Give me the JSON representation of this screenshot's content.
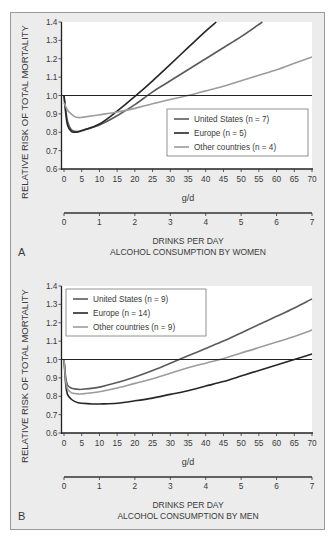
{
  "chart_data": [
    {
      "type": "line",
      "panel_label": "A",
      "title": "ALCOHOL CONSUMPTION BY WOMEN",
      "xlabel": "g/d",
      "xlabel_secondary": "DRINKS PER DAY",
      "ylabel": "RELATIVE RISK OF TOTAL MORTALITY",
      "xlim": [
        0,
        70
      ],
      "ylim": [
        0.6,
        1.4
      ],
      "xticks": [
        "0",
        "5",
        "10",
        "15",
        "20",
        "25",
        "30",
        "35",
        "40",
        "45",
        "50",
        "55",
        "60",
        "65",
        "70"
      ],
      "xticks_secondary": [
        "0",
        "1",
        "2",
        "3",
        "4",
        "5",
        "6",
        "7"
      ],
      "yticks": [
        "1.4",
        "1.3",
        "1.2",
        "1.1",
        "1.0",
        "0.9",
        "0.8",
        "0.7",
        "0.6"
      ],
      "reference_line": 1.0,
      "legend_position": "center-right",
      "grid": false,
      "series": [
        {
          "name": "United States (n = 7)",
          "color": "#5a5a5a",
          "x": [
            0,
            0.5,
            1,
            2,
            3,
            4,
            5,
            10,
            15,
            20,
            25,
            30,
            35,
            40,
            45,
            50,
            56
          ],
          "values": [
            1.0,
            0.92,
            0.86,
            0.815,
            0.805,
            0.805,
            0.81,
            0.84,
            0.89,
            0.95,
            1.02,
            1.08,
            1.14,
            1.2,
            1.26,
            1.32,
            1.4
          ]
        },
        {
          "name": "Europe (n = 5)",
          "color": "#262626",
          "x": [
            0,
            0.5,
            1,
            2,
            3,
            4,
            5,
            10,
            15,
            20,
            25,
            30,
            35,
            40,
            43
          ],
          "values": [
            1.0,
            0.9,
            0.84,
            0.805,
            0.8,
            0.802,
            0.808,
            0.845,
            0.915,
            0.995,
            1.08,
            1.17,
            1.26,
            1.35,
            1.4
          ]
        },
        {
          "name": "Other countries (n = 4)",
          "color": "#9c9c9c",
          "x": [
            0,
            1,
            2,
            3,
            4,
            5,
            10,
            15,
            20,
            25,
            30,
            35,
            40,
            45,
            50,
            55,
            60,
            65,
            70
          ],
          "values": [
            0.96,
            0.92,
            0.9,
            0.885,
            0.88,
            0.881,
            0.895,
            0.91,
            0.93,
            0.955,
            0.978,
            1.0,
            1.025,
            1.05,
            1.08,
            1.11,
            1.14,
            1.175,
            1.21
          ]
        }
      ]
    },
    {
      "type": "line",
      "panel_label": "B",
      "title": "ALCOHOL CONSUMPTION BY MEN",
      "xlabel": "g/d",
      "xlabel_secondary": "DRINKS PER DAY",
      "ylabel": "RELATIVE RISK OF TOTAL MORTALITY",
      "xlim": [
        0,
        70
      ],
      "ylim": [
        0.6,
        1.4
      ],
      "xticks": [
        "0",
        "5",
        "10",
        "15",
        "20",
        "25",
        "30",
        "35",
        "40",
        "45",
        "50",
        "55",
        "60",
        "65",
        "70"
      ],
      "xticks_secondary": [
        "0",
        "1",
        "2",
        "3",
        "4",
        "5",
        "6",
        "7"
      ],
      "yticks": [
        "1.4",
        "1.3",
        "1.2",
        "1.1",
        "1.0",
        "0.9",
        "0.8",
        "0.7",
        "0.6"
      ],
      "reference_line": 1.0,
      "legend_position": "upper-left",
      "grid": false,
      "series": [
        {
          "name": "United States (n = 9)",
          "color": "#5a5a5a",
          "x": [
            0,
            0.5,
            1,
            2,
            3,
            4,
            5,
            10,
            15,
            20,
            25,
            30,
            35,
            40,
            45,
            50,
            55,
            60,
            65,
            70
          ],
          "values": [
            1.0,
            0.9,
            0.86,
            0.845,
            0.84,
            0.838,
            0.838,
            0.85,
            0.875,
            0.905,
            0.94,
            0.98,
            1.02,
            1.06,
            1.1,
            1.145,
            1.19,
            1.235,
            1.28,
            1.33
          ]
        },
        {
          "name": "Europe (n = 14)",
          "color": "#262626",
          "x": [
            0,
            0.5,
            1,
            2,
            3,
            4,
            5,
            8,
            10,
            15,
            20,
            25,
            30,
            35,
            40,
            45,
            50,
            55,
            60,
            65,
            70
          ],
          "values": [
            1.0,
            0.86,
            0.81,
            0.785,
            0.772,
            0.765,
            0.762,
            0.758,
            0.758,
            0.762,
            0.775,
            0.79,
            0.81,
            0.83,
            0.855,
            0.88,
            0.91,
            0.94,
            0.97,
            1.0,
            1.03
          ]
        },
        {
          "name": "Other countries (n = 9)",
          "color": "#9c9c9c",
          "x": [
            0,
            0.5,
            1,
            2,
            3,
            4,
            5,
            10,
            15,
            20,
            25,
            30,
            35,
            40,
            45,
            50,
            55,
            60,
            65,
            70
          ],
          "values": [
            1.0,
            0.88,
            0.84,
            0.82,
            0.815,
            0.813,
            0.813,
            0.825,
            0.845,
            0.87,
            0.895,
            0.925,
            0.955,
            0.98,
            1.005,
            1.035,
            1.065,
            1.095,
            1.125,
            1.16
          ]
        }
      ]
    }
  ]
}
